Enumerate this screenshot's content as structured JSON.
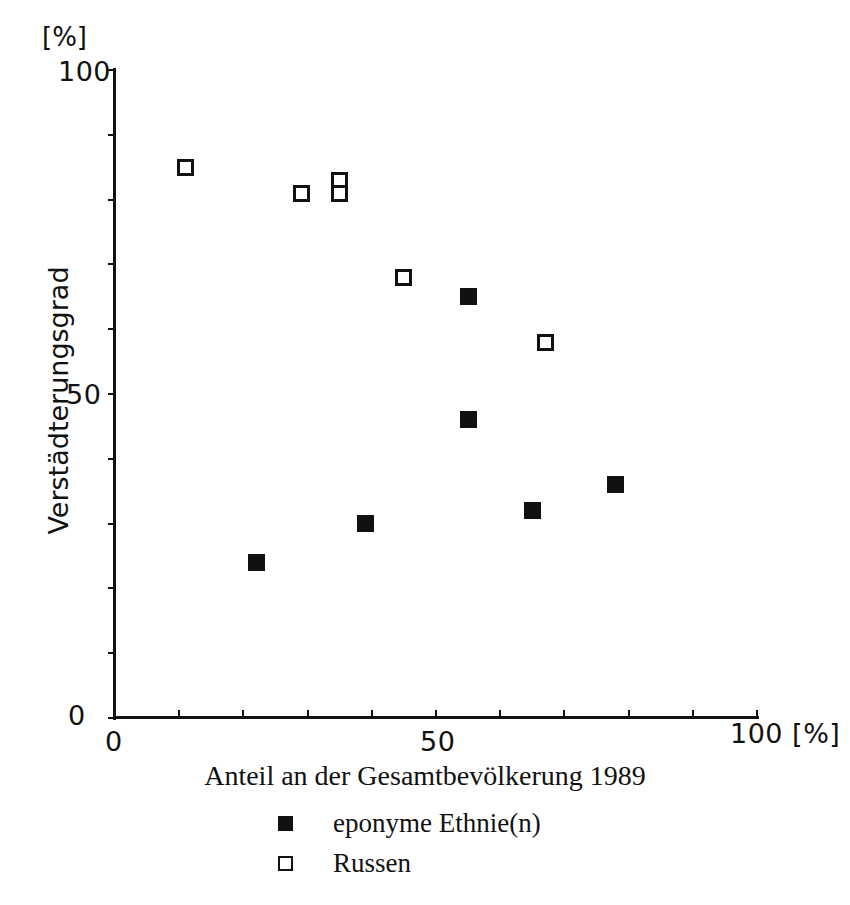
{
  "chart_data": {
    "type": "scatter",
    "title": "",
    "xlabel": "Anteil an der Gesamtbevölkerung 1989",
    "ylabel": "Verstädterungsgrad",
    "x_unit": "[%]",
    "y_unit": "[%]",
    "xlim": [
      0,
      100
    ],
    "ylim": [
      0,
      100
    ],
    "xticks": [
      0,
      10,
      20,
      30,
      40,
      50,
      60,
      70,
      80,
      90,
      100
    ],
    "yticks": [
      0,
      10,
      20,
      30,
      40,
      50,
      60,
      70,
      80,
      90,
      100
    ],
    "xtick_labels_shown": [
      "0",
      "50",
      "100"
    ],
    "ytick_labels_shown": [
      "0",
      "50",
      "100"
    ],
    "grid": false,
    "legend_position": "below-axis-center",
    "series": [
      {
        "name": "eponyme Ethnie(n)",
        "marker": "filled-square",
        "color": "#111111",
        "points": [
          {
            "x": 22,
            "y": 24
          },
          {
            "x": 39,
            "y": 30
          },
          {
            "x": 55,
            "y": 46
          },
          {
            "x": 55,
            "y": 65
          },
          {
            "x": 65,
            "y": 32
          },
          {
            "x": 78,
            "y": 36
          }
        ]
      },
      {
        "name": "Russen",
        "marker": "open-square",
        "color": "#111111",
        "points": [
          {
            "x": 11,
            "y": 85
          },
          {
            "x": 29,
            "y": 81
          },
          {
            "x": 35,
            "y": 83
          },
          {
            "x": 35,
            "y": 81
          },
          {
            "x": 45,
            "y": 68
          },
          {
            "x": 67,
            "y": 58
          }
        ]
      }
    ]
  },
  "axis_labels": {
    "y_top_unit": "[%]",
    "y_100": "100",
    "y_50": "50",
    "y_0": "0",
    "x_0": "0",
    "x_50": "50",
    "x_100_with_unit": "100 [%]",
    "y_title": "Verstädterungsgrad",
    "x_title": "Anteil an der Gesamtbevölkerung 1989"
  },
  "legend": {
    "entries": [
      {
        "label": "eponyme Ethnie(n)",
        "marker": "filled-square"
      },
      {
        "label": "Russen",
        "marker": "open-square"
      }
    ]
  }
}
